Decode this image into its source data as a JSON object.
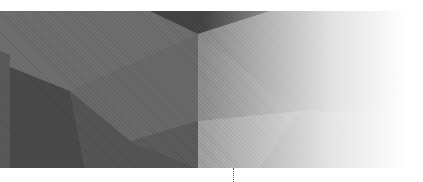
{
  "banner": {
    "description": "low-poly geometric grayscale background",
    "colors": {
      "base": "#6e6e6e",
      "dark": "#4f4f4f",
      "darker": "#3e3e3e",
      "mid": "#7a7a7a",
      "light": "#8e8e8e",
      "lighter": "#a0a0a0",
      "fade_to": "#ffffff"
    }
  },
  "decorations": {
    "dotted_line": true
  }
}
